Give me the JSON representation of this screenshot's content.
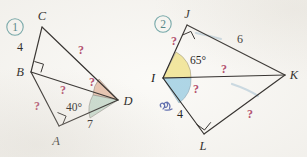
{
  "page": {
    "background_color": "#fbfaf7",
    "ink_color": "#2b2826",
    "question_mark_color": "#b34a6b",
    "circle_number_color": "#6fa6a8",
    "annotation_color": "#4f5fa8"
  },
  "figures": [
    {
      "id": "figure-1",
      "number": "1",
      "vertices": [
        {
          "name": "A",
          "label": "A"
        },
        {
          "name": "B",
          "label": "B"
        },
        {
          "name": "C",
          "label": "C"
        },
        {
          "name": "D",
          "label": "D"
        }
      ],
      "side_labels": [
        {
          "name": "length-bc",
          "value": "4"
        },
        {
          "name": "length-ad",
          "value": "7"
        }
      ],
      "angle_labels": [
        {
          "name": "angle-bda",
          "value": "40°"
        }
      ],
      "unknowns": [
        {
          "name": "unknown-cd",
          "value": "?"
        },
        {
          "name": "unknown-ab",
          "value": "?"
        },
        {
          "name": "unknown-bd",
          "value": "?"
        },
        {
          "name": "unknown-angle-bdc",
          "value": "?"
        }
      ],
      "right_angles": [
        {
          "name": "right-angle-at-b"
        },
        {
          "name": "right-angle-at-a"
        }
      ],
      "shaded_angles": [
        {
          "name": "shaded-angle-bdc",
          "color": "#e9c3ae"
        },
        {
          "name": "shaded-angle-bda",
          "color": "#c9ddd0"
        }
      ]
    },
    {
      "id": "figure-2",
      "number": "2",
      "vertices": [
        {
          "name": "I",
          "label": "I"
        },
        {
          "name": "J",
          "label": "J"
        },
        {
          "name": "K",
          "label": "K"
        },
        {
          "name": "L",
          "label": "L"
        }
      ],
      "side_labels": [
        {
          "name": "length-jk",
          "value": "6"
        },
        {
          "name": "length-il",
          "value": "4"
        }
      ],
      "angle_labels": [
        {
          "name": "angle-jik",
          "value": "65°"
        }
      ],
      "unknowns": [
        {
          "name": "unknown-ij",
          "value": "?"
        },
        {
          "name": "unknown-ik",
          "value": "?"
        },
        {
          "name": "unknown-angle-kil",
          "value": "?"
        },
        {
          "name": "unknown-lk",
          "value": "?"
        }
      ],
      "right_angles": [
        {
          "name": "right-angle-at-j"
        },
        {
          "name": "right-angle-at-l"
        }
      ],
      "shaded_angles": [
        {
          "name": "shaded-angle-jik",
          "color": "#f3e79b"
        },
        {
          "name": "shaded-angle-kil",
          "color": "#a8d3e6"
        }
      ],
      "annotations": [
        {
          "name": "handwritten-mark",
          "value": ""
        }
      ]
    }
  ]
}
